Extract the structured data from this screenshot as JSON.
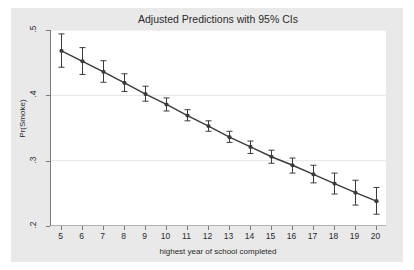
{
  "chart_data": {
    "type": "line",
    "title": "Adjusted Predictions with 95% CIs",
    "xlabel": "highest year of school completed",
    "ylabel": "Pr(Smoke)",
    "xlim": [
      4.5,
      20.5
    ],
    "ylim": [
      0.2,
      0.5
    ],
    "grid": true,
    "legend": "none",
    "xticks": [
      "5",
      "6",
      "7",
      "8",
      "9",
      "10",
      "11",
      "12",
      "13",
      "14",
      "15",
      "16",
      "17",
      "18",
      "19",
      "20"
    ],
    "yticks": [
      ".5",
      ".4",
      ".3",
      ".2"
    ],
    "x": [
      5,
      6,
      7,
      8,
      9,
      10,
      11,
      12,
      13,
      14,
      15,
      16,
      17,
      18,
      19,
      20
    ],
    "values": [
      0.468,
      0.452,
      0.436,
      0.419,
      0.402,
      0.386,
      0.369,
      0.353,
      0.336,
      0.321,
      0.306,
      0.293,
      0.279,
      0.265,
      0.251,
      0.238
    ],
    "ci_low": [
      0.443,
      0.432,
      0.42,
      0.406,
      0.391,
      0.376,
      0.361,
      0.345,
      0.328,
      0.311,
      0.296,
      0.281,
      0.266,
      0.249,
      0.232,
      0.218
    ],
    "ci_high": [
      0.494,
      0.473,
      0.453,
      0.433,
      0.414,
      0.396,
      0.378,
      0.361,
      0.345,
      0.33,
      0.316,
      0.304,
      0.293,
      0.281,
      0.27,
      0.259
    ],
    "marker_color": "#3b3b3b",
    "line_color": "#3b3b3b",
    "grid_color": "#e6e6e6",
    "axis_color": "#7a7a7a",
    "figure_background": "#e9e9e9",
    "plot_background": "#ffffff"
  }
}
